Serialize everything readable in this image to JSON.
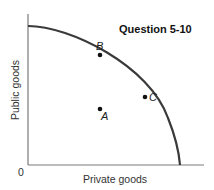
{
  "title": "Question 5-10",
  "axes": {
    "x_label": "Private goods",
    "y_label": "Public goods",
    "origin_label": "0"
  },
  "curve": {
    "type": "production-possibilities-frontier",
    "description": "Concave curve from the public-goods axis to the private-goods axis"
  },
  "points": [
    {
      "label": "A",
      "position": "inside the frontier"
    },
    {
      "label": "B",
      "position": "on the frontier"
    },
    {
      "label": "C",
      "position": "on the frontier"
    }
  ],
  "colors": {
    "curve": "#3a3a3a",
    "axis": "#7a7a7a",
    "text": "#222222"
  }
}
